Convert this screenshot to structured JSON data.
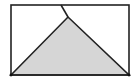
{
  "diagram": {
    "type": "geometry-figure",
    "canvas": {
      "width": 134,
      "height": 81,
      "background": "#ffffff"
    },
    "rectangle": {
      "x": 11,
      "y": 5,
      "width": 118,
      "height": 70,
      "stroke": "#222222",
      "stroke_width": 1.6,
      "fill": "none"
    },
    "triangle": {
      "points": [
        [
          11,
          75
        ],
        [
          68,
          17
        ],
        [
          129,
          75
        ]
      ],
      "fill": "#d6d6d6",
      "stroke": "#222222",
      "stroke_width": 1.6
    },
    "fold_line": {
      "from": [
        61,
        5
      ],
      "to": [
        68,
        17
      ],
      "stroke": "#222222",
      "stroke_width": 1.6
    },
    "vertices": [
      {
        "name": "bottom-left",
        "x": 11,
        "y": 75,
        "r": 1.4
      },
      {
        "name": "bottom-right",
        "x": 129,
        "y": 75,
        "r": 1.4
      }
    ],
    "labels": []
  }
}
